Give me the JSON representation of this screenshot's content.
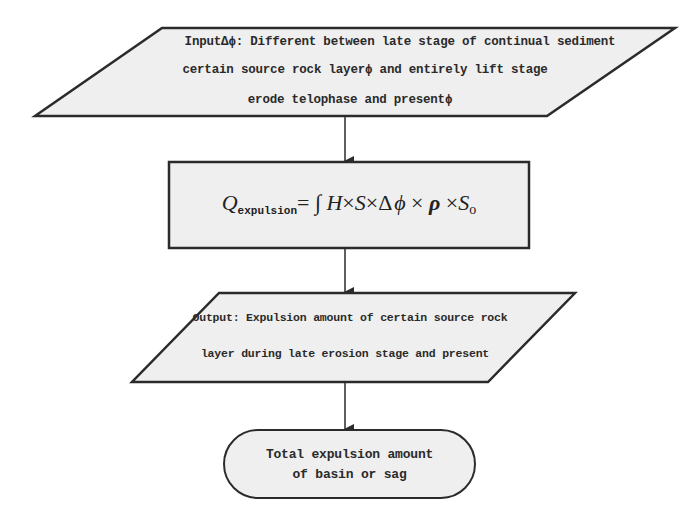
{
  "diagram": {
    "type": "flowchart",
    "colors": {
      "shape_fill": "#efefef",
      "stroke": "#2b2b2b",
      "background": "#ffffff",
      "text": "#2a2a2a"
    },
    "nodes": [
      {
        "id": "input",
        "shape": "parallelogram",
        "lines": [
          "InputΔϕ: Different between late stage of continual sediment",
          "certain source rock layerϕ and entirely lift stage",
          "erode telophase and presentϕ"
        ]
      },
      {
        "id": "process",
        "shape": "rectangle",
        "formula": {
          "lhs": "Q",
          "lhs_subscript": "expulsion",
          "equals": "=",
          "integral": "∫",
          "H": "H",
          "times": "×",
          "S": "S",
          "delta": "Δ",
          "phi": "ϕ",
          "rho": "ρ",
          "S_o": "S",
          "S_o_subscript": "o"
        }
      },
      {
        "id": "output",
        "shape": "parallelogram",
        "lines": [
          "Output: Expulsion amount of certain source rock",
          "layer during late erosion stage and present"
        ]
      },
      {
        "id": "total",
        "shape": "terminal",
        "lines": [
          "Total expulsion amount",
          "of basin or sag"
        ]
      }
    ],
    "edges": [
      {
        "from": "input",
        "to": "process"
      },
      {
        "from": "process",
        "to": "output"
      },
      {
        "from": "output",
        "to": "total"
      }
    ]
  }
}
